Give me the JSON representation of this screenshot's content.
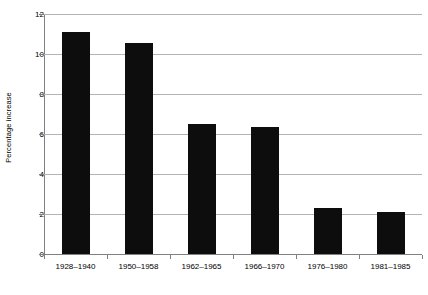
{
  "chart_data": {
    "type": "bar",
    "title": "",
    "xlabel": "",
    "ylabel": "Percentage increase",
    "categories": [
      "1928–1940",
      "1950–1958",
      "1962–1965",
      "1966–1970",
      "1976–1980",
      "1981–1985"
    ],
    "values": [
      11.1,
      10.55,
      6.5,
      6.35,
      2.3,
      2.1
    ],
    "ylim": [
      0,
      12
    ],
    "ytick_labels": [
      "0",
      "2",
      "4",
      "6",
      "8",
      "10",
      "12"
    ],
    "ytick_values": [
      0,
      2,
      4,
      6,
      8,
      10,
      12
    ],
    "grid": true,
    "grid_axis": "y",
    "legend": false,
    "bar_color": "#0d0d0d",
    "gridline_color": "#b3b3b3",
    "axis_color": "#808080",
    "background_color": "#ffffff"
  }
}
